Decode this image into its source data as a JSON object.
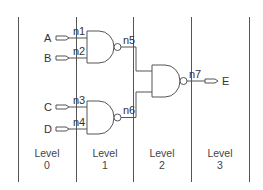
{
  "diagram": {
    "type": "logic-circuit",
    "inputs": [
      {
        "name": "A",
        "net": "n1"
      },
      {
        "name": "B",
        "net": "n2"
      },
      {
        "name": "C",
        "net": "n3"
      },
      {
        "name": "D",
        "net": "n4"
      }
    ],
    "outputs": [
      {
        "name": "E",
        "net": "n7"
      }
    ],
    "gates": [
      {
        "id": "g1",
        "type": "NAND",
        "inputs": [
          "n1",
          "n2"
        ],
        "output": "n5",
        "level": 1
      },
      {
        "id": "g2",
        "type": "NAND",
        "inputs": [
          "n3",
          "n4"
        ],
        "output": "n6",
        "level": 1
      },
      {
        "id": "g3",
        "type": "NAND",
        "inputs": [
          "n5",
          "n6"
        ],
        "output": "n7",
        "level": 2
      }
    ],
    "nets": [
      "n1",
      "n2",
      "n3",
      "n4",
      "n5",
      "n6",
      "n7"
    ],
    "levels": [
      {
        "word": "Level",
        "num": "0"
      },
      {
        "word": "Level",
        "num": "1"
      },
      {
        "word": "Level",
        "num": "2"
      },
      {
        "word": "Level",
        "num": "3"
      }
    ],
    "colors": {
      "line": "#555555",
      "text": "#333333",
      "background": "#ffffff"
    }
  }
}
